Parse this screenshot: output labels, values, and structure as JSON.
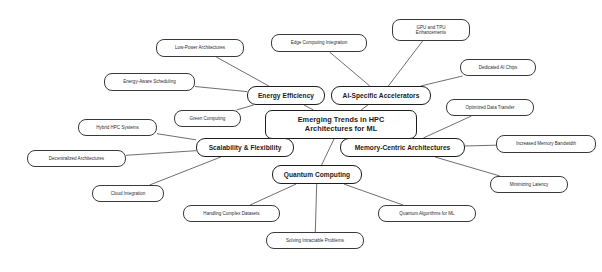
{
  "diagram": {
    "type": "mind-map",
    "background_color": "#ffffff",
    "node_fill": "#ffffff",
    "node_stroke": "#1d1d1d",
    "edge_color": "#4a4a4a",
    "central": {
      "label": "Emerging Trends in HPC\nArchitectures for ML",
      "x": 265,
      "y": 110,
      "w": 152,
      "h": 29
    },
    "branches": [
      {
        "label": "Energy Efficiency",
        "x": 247,
        "y": 86,
        "w": 78,
        "h": 19,
        "children": [
          {
            "label": "Low-Power Architectures",
            "x": 156,
            "y": 39,
            "w": 88,
            "h": 18
          },
          {
            "label": "Energy-Aware Scheduling",
            "x": 104,
            "y": 73,
            "w": 91,
            "h": 18
          },
          {
            "label": "Green Computing",
            "x": 174,
            "y": 110,
            "w": 67,
            "h": 17
          }
        ]
      },
      {
        "label": "AI-Specific Accelerators",
        "x": 331,
        "y": 86,
        "w": 100,
        "h": 19,
        "children": [
          {
            "label": "Edge Computing Integration",
            "x": 271,
            "y": 34,
            "w": 96,
            "h": 18
          },
          {
            "label": "GPU and TPU\nEnhancements",
            "x": 392,
            "y": 19,
            "w": 78,
            "h": 22
          },
          {
            "label": "Dedicated AI Chips",
            "x": 460,
            "y": 59,
            "w": 76,
            "h": 17
          }
        ]
      },
      {
        "label": "Memory-Centric Architectures",
        "x": 340,
        "y": 138,
        "w": 125,
        "h": 19,
        "children": [
          {
            "label": "Optimized Data Transfer",
            "x": 446,
            "y": 99,
            "w": 88,
            "h": 17
          },
          {
            "label": "Increased Memory Bandwidth",
            "x": 496,
            "y": 135,
            "w": 100,
            "h": 18
          },
          {
            "label": "Minimizing Latency",
            "x": 490,
            "y": 176,
            "w": 78,
            "h": 17
          }
        ]
      },
      {
        "label": "Quantum Computing",
        "x": 272,
        "y": 165,
        "w": 90,
        "h": 19,
        "children": [
          {
            "label": "Quantum Algorithms for ML",
            "x": 378,
            "y": 205,
            "w": 98,
            "h": 17
          },
          {
            "label": "Solving Intractable Problems",
            "x": 266,
            "y": 232,
            "w": 98,
            "h": 17
          },
          {
            "label": "Handling Complex Datasets",
            "x": 183,
            "y": 205,
            "w": 97,
            "h": 17
          }
        ]
      },
      {
        "label": "Scalability & Flexibility",
        "x": 196,
        "y": 138,
        "w": 98,
        "h": 19,
        "children": [
          {
            "label": "Hybrid HPC Systems",
            "x": 78,
            "y": 119,
            "w": 79,
            "h": 17
          },
          {
            "label": "Decentralized Architectures",
            "x": 27,
            "y": 150,
            "w": 99,
            "h": 17
          },
          {
            "label": "Cloud Integration",
            "x": 92,
            "y": 185,
            "w": 72,
            "h": 17
          }
        ]
      }
    ],
    "edges": [
      {
        "from": "central",
        "to": "Energy Efficiency",
        "x1": 286,
        "y1": 110,
        "x2": 286,
        "y2": 105
      },
      {
        "from": "central",
        "to": "AI-Specific Accelerators",
        "x1": 381,
        "y1": 110,
        "x2": 381,
        "y2": 105
      },
      {
        "from": "central",
        "to": "Memory-Centric Architectures",
        "x1": 385,
        "y1": 139,
        "x2": 385,
        "y2": 138
      },
      {
        "from": "central",
        "to": "Quantum Computing",
        "x1": 300,
        "y1": 139,
        "x2": 300,
        "y2": 165
      },
      {
        "from": "central",
        "to": "Scalability & Flexibility",
        "x1": 265,
        "y1": 134,
        "x2": 245,
        "y2": 145
      }
    ]
  }
}
